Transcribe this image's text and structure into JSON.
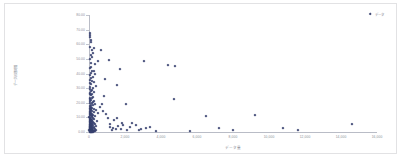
{
  "chart_data": {
    "type": "scatter",
    "title": "",
    "xlabel": "データ量",
    "ylabel": "データ処理時間",
    "xlim": [
      0,
      16000
    ],
    "ylim": [
      0,
      80
    ],
    "grid": false,
    "legend_position": "top-right",
    "series": [
      {
        "name": "データ",
        "color": "#37406f",
        "marker": "diamond",
        "points": [
          [
            40,
            67.5
          ],
          [
            55,
            66.2
          ],
          [
            70,
            64.8
          ],
          [
            120,
            63.1
          ],
          [
            95,
            61.4
          ],
          [
            60,
            58.0
          ],
          [
            300,
            57.2
          ],
          [
            180,
            56.1
          ],
          [
            640,
            55.8
          ],
          [
            215,
            54.0
          ],
          [
            85,
            52.6
          ],
          [
            150,
            51.2
          ],
          [
            70,
            49.8
          ],
          [
            1100,
            49.0
          ],
          [
            480,
            48.4
          ],
          [
            3050,
            48.6
          ],
          [
            95,
            47.0
          ],
          [
            310,
            46.2
          ],
          [
            4400,
            45.9
          ],
          [
            4780,
            45.2
          ],
          [
            130,
            44.6
          ],
          [
            60,
            43.8
          ],
          [
            1700,
            43.2
          ],
          [
            250,
            42.0
          ],
          [
            170,
            41.4
          ],
          [
            90,
            40.2
          ],
          [
            355,
            39.6
          ],
          [
            75,
            38.8
          ],
          [
            200,
            37.9
          ],
          [
            110,
            37.1
          ],
          [
            900,
            36.4
          ],
          [
            45,
            35.8
          ],
          [
            160,
            35.0
          ],
          [
            260,
            34.2
          ],
          [
            65,
            33.5
          ],
          [
            120,
            32.8
          ],
          [
            1550,
            31.9
          ],
          [
            380,
            31.2
          ],
          [
            80,
            30.6
          ],
          [
            210,
            30.0
          ],
          [
            55,
            29.4
          ],
          [
            145,
            28.8
          ],
          [
            95,
            28.1
          ],
          [
            300,
            27.5
          ],
          [
            70,
            26.9
          ],
          [
            185,
            26.3
          ],
          [
            40,
            25.8
          ],
          [
            125,
            25.2
          ],
          [
            820,
            24.6
          ],
          [
            235,
            24.0
          ],
          [
            60,
            23.5
          ],
          [
            160,
            23.0
          ],
          [
            4700,
            22.7
          ],
          [
            35,
            22.4
          ],
          [
            110,
            21.9
          ],
          [
            275,
            21.4
          ],
          [
            75,
            20.9
          ],
          [
            195,
            20.4
          ],
          [
            50,
            20.0
          ],
          [
            140,
            19.6
          ],
          [
            2050,
            19.3
          ],
          [
            330,
            19.0
          ],
          [
            85,
            18.6
          ],
          [
            225,
            18.2
          ],
          [
            45,
            17.8
          ],
          [
            115,
            17.4
          ],
          [
            600,
            17.0
          ],
          [
            165,
            16.7
          ],
          [
            65,
            16.3
          ],
          [
            250,
            16.0
          ],
          [
            30,
            15.7
          ],
          [
            100,
            15.4
          ],
          [
            400,
            15.1
          ],
          [
            135,
            14.8
          ],
          [
            55,
            14.5
          ],
          [
            190,
            14.2
          ],
          [
            75,
            13.9
          ],
          [
            280,
            13.6
          ],
          [
            40,
            13.3
          ],
          [
            120,
            13.0
          ],
          [
            480,
            12.7
          ],
          [
            160,
            12.4
          ],
          [
            60,
            12.1
          ],
          [
            210,
            11.8
          ],
          [
            35,
            11.6
          ],
          [
            95,
            11.3
          ],
          [
            350,
            11.0
          ],
          [
            145,
            10.8
          ],
          [
            50,
            10.5
          ],
          [
            175,
            10.2
          ],
          [
            9200,
            11.5
          ],
          [
            6500,
            11.2
          ],
          [
            25,
            10.0
          ],
          [
            80,
            9.8
          ],
          [
            240,
            9.5
          ],
          [
            110,
            9.2
          ],
          [
            45,
            9.0
          ],
          [
            300,
            8.8
          ],
          [
            130,
            8.5
          ],
          [
            60,
            8.3
          ],
          [
            185,
            8.0
          ],
          [
            30,
            7.8
          ],
          [
            90,
            7.6
          ],
          [
            420,
            7.4
          ],
          [
            150,
            7.2
          ],
          [
            55,
            7.0
          ],
          [
            200,
            6.8
          ],
          [
            38,
            6.6
          ],
          [
            105,
            6.4
          ],
          [
            265,
            6.2
          ],
          [
            140,
            6.0
          ],
          [
            48,
            5.8
          ],
          [
            170,
            5.6
          ],
          [
            70,
            5.4
          ],
          [
            320,
            5.2
          ],
          [
            28,
            5.0
          ],
          [
            95,
            4.9
          ],
          [
            220,
            4.7
          ],
          [
            125,
            4.5
          ],
          [
            52,
            4.4
          ],
          [
            160,
            4.2
          ],
          [
            80,
            4.0
          ],
          [
            380,
            3.9
          ],
          [
            35,
            3.7
          ],
          [
            110,
            3.6
          ],
          [
            255,
            3.4
          ],
          [
            145,
            3.3
          ],
          [
            62,
            3.1
          ],
          [
            190,
            3.0
          ],
          [
            42,
            2.9
          ],
          [
            98,
            2.7
          ],
          [
            290,
            2.6
          ],
          [
            135,
            2.5
          ],
          [
            58,
            2.4
          ],
          [
            175,
            2.2
          ],
          [
            75,
            2.1
          ],
          [
            340,
            2.0
          ],
          [
            32,
            1.9
          ],
          [
            105,
            1.8
          ],
          [
            230,
            1.7
          ],
          [
            150,
            1.6
          ],
          [
            50,
            1.5
          ],
          [
            185,
            1.4
          ],
          [
            85,
            1.3
          ],
          [
            410,
            1.2
          ],
          [
            26,
            1.1
          ],
          [
            115,
            1.0
          ],
          [
            270,
            0.9
          ],
          [
            140,
            0.85
          ],
          [
            65,
            0.8
          ],
          [
            200,
            0.75
          ],
          [
            45,
            0.7
          ],
          [
            100,
            0.65
          ],
          [
            310,
            0.6
          ],
          [
            155,
            0.55
          ],
          [
            70,
            0.5
          ],
          [
            215,
            0.45
          ],
          [
            38,
            0.4
          ],
          [
            125,
            0.38
          ],
          [
            250,
            0.35
          ],
          [
            90,
            0.32
          ],
          [
            170,
            0.3
          ],
          [
            55,
            0.28
          ],
          [
            230,
            0.26
          ],
          [
            110,
            0.24
          ],
          [
            1350,
            2.8
          ],
          [
            1180,
            3.6
          ],
          [
            1620,
            4.3
          ],
          [
            1480,
            1.9
          ],
          [
            1250,
            1.4
          ],
          [
            1900,
            5.1
          ],
          [
            2250,
            3.2
          ],
          [
            1750,
            2.3
          ],
          [
            2600,
            4.8
          ],
          [
            2100,
            1.6
          ],
          [
            2900,
            2.1
          ],
          [
            3400,
            3.4
          ],
          [
            2750,
            1.2
          ],
          [
            3150,
            2.6
          ],
          [
            3700,
            1.0
          ],
          [
            5600,
            0.9
          ],
          [
            7200,
            3.0
          ],
          [
            8000,
            1.1
          ],
          [
            10800,
            2.4
          ],
          [
            11600,
            1.5
          ],
          [
            14600,
            5.4
          ],
          [
            1050,
            9.3
          ],
          [
            1400,
            7.9
          ],
          [
            1850,
            6.2
          ],
          [
            950,
            12.5
          ],
          [
            780,
            14.1
          ],
          [
            1150,
            5.7
          ],
          [
            1550,
            9.9
          ],
          [
            2400,
            5.9
          ],
          [
            700,
            18.9
          ]
        ]
      }
    ],
    "y_ticks": [
      "0.00",
      "10.00",
      "20.00",
      "30.00",
      "40.00",
      "50.00",
      "60.00",
      "70.00",
      "80.00"
    ],
    "y_tick_values": [
      0,
      10,
      20,
      30,
      40,
      50,
      60,
      70,
      80
    ],
    "x_ticks": [
      "0",
      "2,000",
      "4,000",
      "6,000",
      "8,000",
      "10,000",
      "12,000",
      "14,000",
      "16,000"
    ],
    "x_tick_values": [
      0,
      2000,
      4000,
      6000,
      8000,
      10000,
      12000,
      14000,
      16000
    ]
  },
  "legend": {
    "entries": [
      {
        "label": "データ",
        "color": "#37406f"
      }
    ]
  }
}
